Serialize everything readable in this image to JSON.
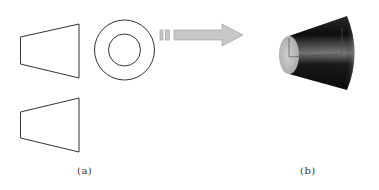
{
  "figure": {
    "panel_a": {
      "caption": "(a)",
      "views": [
        "front-view-trapezoid",
        "side-view-concentric-circles",
        "top-view-trapezoid"
      ]
    },
    "arrow": {
      "direction": "right",
      "color": "#c8c8c8"
    },
    "panel_b": {
      "caption": "(b)",
      "object": "truncated-cone-3d"
    }
  },
  "colors": {
    "line": "#333333",
    "arrow_fill": "#c8c8c8",
    "arrow_stroke": "#9a9a9a",
    "cone_dark": "#111111",
    "cone_light": "#bdbdbd"
  }
}
